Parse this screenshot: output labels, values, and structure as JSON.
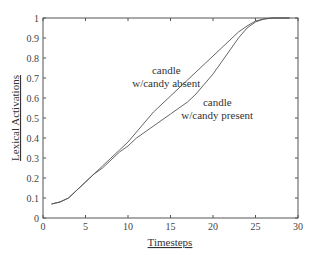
{
  "chart_data": {
    "type": "line",
    "title": "",
    "xlabel": "Timesteps",
    "ylabel": "Lexical Activations",
    "xlim": [
      0,
      30
    ],
    "ylim": [
      0,
      1
    ],
    "xticks": [
      0,
      5,
      10,
      15,
      20,
      25,
      30
    ],
    "yticks": [
      0,
      0.1,
      0.2,
      0.3,
      0.4,
      0.5,
      0.6,
      0.7,
      0.8,
      0.9,
      1
    ],
    "grid": false,
    "legend": null,
    "annotations": [
      {
        "lines": [
          "candle",
          "w/candy absent"
        ],
        "x": 14.5,
        "y": 0.72
      },
      {
        "lines": [
          "candle",
          "w/candy present"
        ],
        "x": 20.5,
        "y": 0.56
      }
    ],
    "series": [
      {
        "name": "candle w/candy absent",
        "x": [
          1,
          2,
          3,
          4,
          5,
          6,
          7,
          8,
          9,
          10,
          11,
          12,
          13,
          14,
          15,
          16,
          17,
          18,
          19,
          20,
          21,
          22,
          23,
          24,
          25,
          26,
          27,
          28,
          29
        ],
        "values": [
          0.07,
          0.08,
          0.1,
          0.14,
          0.18,
          0.22,
          0.26,
          0.3,
          0.34,
          0.38,
          0.43,
          0.48,
          0.53,
          0.57,
          0.61,
          0.65,
          0.69,
          0.73,
          0.77,
          0.81,
          0.85,
          0.89,
          0.93,
          0.96,
          0.985,
          0.995,
          1.0,
          1.0,
          1.0
        ]
      },
      {
        "name": "candle w/candy present",
        "x": [
          1,
          2,
          3,
          4,
          5,
          6,
          7,
          8,
          9,
          10,
          11,
          12,
          13,
          14,
          15,
          16,
          17,
          18,
          19,
          20,
          21,
          22,
          23,
          24,
          25,
          26,
          27,
          28,
          29
        ],
        "values": [
          0.07,
          0.08,
          0.1,
          0.14,
          0.18,
          0.22,
          0.25,
          0.29,
          0.33,
          0.36,
          0.4,
          0.43,
          0.46,
          0.49,
          0.52,
          0.55,
          0.58,
          0.62,
          0.67,
          0.72,
          0.78,
          0.84,
          0.9,
          0.95,
          0.98,
          0.995,
          1.0,
          1.0,
          1.0
        ]
      }
    ]
  }
}
